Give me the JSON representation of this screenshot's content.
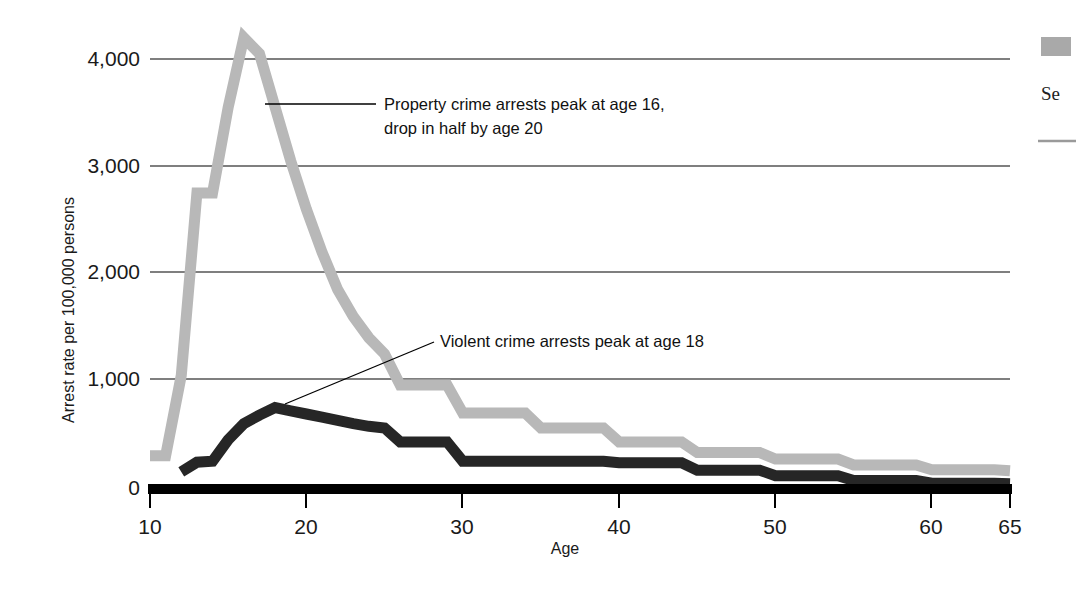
{
  "chart_data": {
    "type": "line",
    "title": "",
    "xlabel": "Age",
    "ylabel": "Arrest rate per 100,000 persons",
    "xlim": [
      10,
      65
    ],
    "ylim": [
      0,
      4400
    ],
    "grid": true,
    "y_ticks": [
      "0",
      "1,000",
      "2,000",
      "3,000",
      "4,000"
    ],
    "y_tick_values": [
      0,
      1000,
      2000,
      3000,
      4000
    ],
    "x_ticks": [
      "10",
      "20",
      "30",
      "40",
      "50",
      "60",
      "65"
    ],
    "x_tick_values": [
      10,
      20,
      30,
      40,
      50,
      60,
      65
    ],
    "legend_position": "right",
    "series": [
      {
        "name": "Property crime",
        "color": "#b8b8b8",
        "x": [
          10,
          11,
          12,
          13,
          14,
          15,
          16,
          17,
          18,
          19,
          20,
          21,
          22,
          23,
          24,
          25,
          26,
          27,
          28,
          29,
          30,
          31,
          32,
          33,
          34,
          35,
          36,
          37,
          38,
          39,
          40,
          41,
          42,
          43,
          44,
          45,
          46,
          47,
          48,
          49,
          50,
          51,
          52,
          53,
          54,
          55,
          56,
          57,
          58,
          59,
          60,
          61,
          62,
          63,
          64,
          65
        ],
        "values": [
          300,
          300,
          1050,
          2750,
          2750,
          3550,
          4200,
          4050,
          3550,
          3050,
          2600,
          2200,
          1850,
          1600,
          1400,
          1250,
          960,
          960,
          960,
          960,
          700,
          700,
          700,
          700,
          700,
          560,
          560,
          560,
          560,
          560,
          430,
          430,
          430,
          430,
          430,
          330,
          330,
          330,
          330,
          330,
          270,
          270,
          270,
          270,
          270,
          215,
          215,
          215,
          215,
          215,
          170,
          170,
          170,
          170,
          170,
          160
        ]
      },
      {
        "name": "Violent crime",
        "color": "#262626",
        "x": [
          12,
          13,
          14,
          15,
          16,
          17,
          18,
          19,
          20,
          21,
          22,
          23,
          24,
          25,
          26,
          27,
          28,
          29,
          30,
          31,
          32,
          33,
          34,
          35,
          36,
          37,
          38,
          39,
          40,
          41,
          42,
          43,
          44,
          45,
          46,
          47,
          48,
          49,
          50,
          51,
          52,
          53,
          54,
          55,
          56,
          57,
          58,
          59,
          60,
          61,
          62,
          63,
          64,
          65
        ],
        "values": [
          150,
          240,
          250,
          450,
          600,
          680,
          750,
          720,
          690,
          660,
          630,
          600,
          575,
          560,
          430,
          430,
          430,
          430,
          250,
          250,
          250,
          250,
          250,
          250,
          250,
          250,
          250,
          250,
          235,
          235,
          235,
          235,
          235,
          165,
          165,
          165,
          165,
          165,
          115,
          115,
          115,
          115,
          115,
          70,
          70,
          70,
          70,
          70,
          45,
          45,
          45,
          45,
          45,
          40
        ]
      }
    ],
    "annotations": [
      {
        "id": "property-annotation",
        "line1": "Property crime arrests peak at age 16,",
        "line2": "drop in half by age 20",
        "points_to_series": "Property crime"
      },
      {
        "id": "violent-annotation",
        "line1": "Violent crime arrests peak at age 18",
        "line2": "",
        "points_to_series": "Violent crime"
      }
    ]
  },
  "legend": {
    "swatch_color": "#a9a9a9",
    "label_partial": "Se",
    "rule_color": "#9a9a9a"
  },
  "axes": {
    "y_label": "Arrest rate per 100,000 persons",
    "x_label": "Age",
    "y_tick_0": "0",
    "y_tick_1000": "1,000",
    "y_tick_2000": "2,000",
    "y_tick_3000": "3,000",
    "y_tick_4000": "4,000",
    "x_tick_10": "10",
    "x_tick_20": "20",
    "x_tick_30": "30",
    "x_tick_40": "40",
    "x_tick_50": "50",
    "x_tick_60": "60",
    "x_tick_65": "65"
  },
  "annotation_text": {
    "property_line1": "Property crime arrests peak at age 16,",
    "property_line2": "drop in half by age 20",
    "violent_line1": "Violent crime arrests peak at age 18"
  },
  "colors": {
    "property_gray": "#b8b8b8",
    "violent_black": "#262626",
    "axis_black": "#000000",
    "background": "#ffffff"
  }
}
